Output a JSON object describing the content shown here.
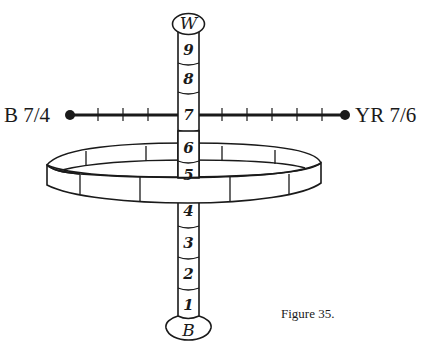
{
  "figure": {
    "caption": "Figure 35.",
    "top_cap_label": "W",
    "bottom_cap_label": "B",
    "value_scale": [
      "1",
      "2",
      "3",
      "4",
      "5",
      "6",
      "7",
      "8",
      "9"
    ],
    "left_endpoint_label": "B 7/4",
    "right_endpoint_label": "YR 7/6",
    "chroma_axis_ticks_left": 3,
    "chroma_axis_ticks_right": 5,
    "colors": {
      "ink": "#1a1a1a",
      "background": "#ffffff"
    }
  }
}
